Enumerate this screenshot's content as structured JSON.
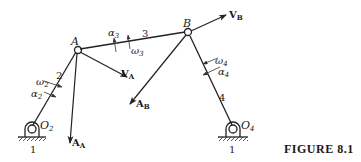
{
  "figure": {
    "caption": "FIGURE 8.1",
    "mechanism": "four-bar linkage"
  },
  "joints": {
    "A": "A",
    "B": "B",
    "O2": "O",
    "O2_sub": "2",
    "O4": "O",
    "O4_sub": "4"
  },
  "links": {
    "ground_left": "1",
    "ground_right": "1",
    "crank": "2",
    "coupler": "3",
    "rocker": "4"
  },
  "vectors": {
    "VA": "V",
    "VA_sub": "A",
    "VB": "V",
    "VB_sub": "B",
    "AA": "A",
    "AA_sub": "A",
    "AB": "A",
    "AB_sub": "B"
  },
  "angular": {
    "omega2": "ω",
    "omega2_sub": "2",
    "alpha2": "α",
    "alpha2_sub": "2",
    "omega3": "ω",
    "omega3_sub": "3",
    "alpha3": "α",
    "alpha3_sub": "3",
    "omega4": "ω",
    "omega4_sub": "4",
    "alpha4": "α",
    "alpha4_sub": "4"
  }
}
